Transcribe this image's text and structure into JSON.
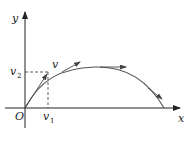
{
  "diagram": {
    "type": "projectile-velocity-decomposition",
    "axes": {
      "x_label": "x",
      "y_label": "y",
      "origin_label": "O"
    },
    "labels": {
      "velocity": "v",
      "v1_base": "v",
      "v1_sub": "1",
      "v2_base": "v",
      "v2_sub": "2"
    },
    "colors": {
      "axis": "#222222",
      "curve": "#555555",
      "dashed": "#333333",
      "arrow": "#444444"
    }
  }
}
